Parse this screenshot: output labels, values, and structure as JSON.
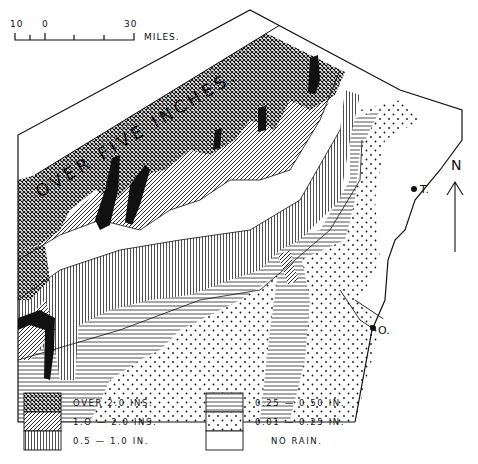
{
  "map": {
    "banner_label": "OVER FIVE INCHES.",
    "scale_bar": {
      "tick_labels": [
        "10",
        "0",
        "30"
      ],
      "unit_label": "MILES."
    },
    "north_arrow_label": "N",
    "towns": [
      {
        "label": "T."
      },
      {
        "label": "O."
      }
    ]
  },
  "legend": {
    "items": [
      {
        "pattern": "cross-hatch",
        "label": "OVER 2.0 INS."
      },
      {
        "pattern": "diagonal-hatch",
        "label": "1.O — 2.0 INS."
      },
      {
        "pattern": "vertical-lines",
        "label": "0.5 — 1.0 IN."
      },
      {
        "pattern": "horizontal-lines",
        "label": "0.25 — 0.50 IN."
      },
      {
        "pattern": "dots",
        "label": "0.01 — 0.25 IN."
      },
      {
        "pattern": "blank",
        "label": "NO RAIN."
      }
    ]
  },
  "colors": {
    "ink": "#111111",
    "paper": "#ffffff"
  }
}
